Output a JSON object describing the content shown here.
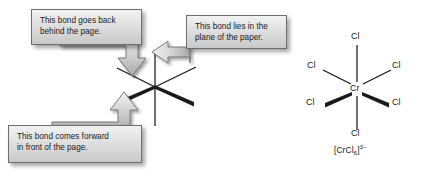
{
  "figure": {
    "background_color": "#ffffff",
    "line_color": "#1a1a1a"
  },
  "callouts": [
    {
      "id": "back",
      "name": "callout-bond-goes-back",
      "line1": "This bond goes back",
      "line2": "behind the page.",
      "arrow_direction": "down",
      "arrow_name": "callout-arrow-down"
    },
    {
      "id": "plane",
      "name": "callout-bond-in-plane",
      "line1": "This bond lies in the",
      "line2": "plane of the paper.",
      "arrow_direction": "left",
      "arrow_name": "callout-arrow-left"
    },
    {
      "id": "forward",
      "name": "callout-bond-comes-forward",
      "line1": "This bond comes forward",
      "line2": "in front of the page.",
      "arrow_direction": "up",
      "arrow_name": "callout-arrow-up"
    }
  ],
  "bond_diagram": {
    "name": "octahedral-bond-convention-diagram",
    "center": {
      "x": 155,
      "y": 87
    },
    "bonds": [
      {
        "name": "bond-vertical-up",
        "type": "plain",
        "note": "in plane of paper"
      },
      {
        "name": "bond-vertical-down",
        "type": "plain",
        "note": "in plane of paper"
      },
      {
        "name": "bond-upper-left",
        "type": "plain",
        "note": "goes back behind page"
      },
      {
        "name": "bond-upper-right",
        "type": "plain",
        "note": "goes back behind page"
      },
      {
        "name": "bond-lower-left",
        "type": "wedge",
        "note": "comes forward in front of page"
      },
      {
        "name": "bond-lower-right",
        "type": "wedge",
        "note": "comes forward in front of page"
      }
    ]
  },
  "structure": {
    "name": "hexachlorochromate-structure",
    "center_atom": "Cr",
    "ligand_label": "Cl",
    "ligands": [
      {
        "position": "top",
        "label": "Cl",
        "bond": "plain"
      },
      {
        "position": "upper-left",
        "label": "Cl",
        "bond": "plain"
      },
      {
        "position": "upper-right",
        "label": "Cl",
        "bond": "plain"
      },
      {
        "position": "lower-left",
        "label": "Cl",
        "bond": "wedge"
      },
      {
        "position": "lower-right",
        "label": "Cl",
        "bond": "wedge"
      },
      {
        "position": "bottom",
        "label": "Cl",
        "bond": "plain"
      }
    ],
    "formula": {
      "open_bracket": "[",
      "metal": "Cr",
      "ligand": "Cl",
      "ligand_count": "6",
      "close_bracket": "]",
      "charge": "3–"
    }
  }
}
